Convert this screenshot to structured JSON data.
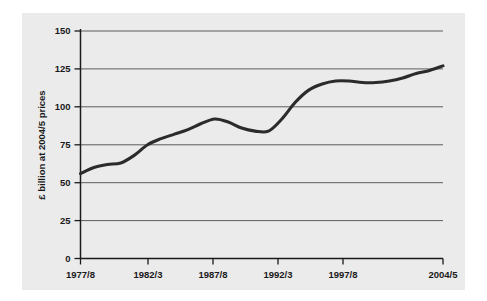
{
  "figure": {
    "background_color": "#ffffff",
    "panel_color": "#ebebeb",
    "line_color": "#2b2b2b",
    "grid_color": "#4d4d4d",
    "axis_color": "#1a1a1a"
  },
  "chart_data": {
    "type": "line",
    "title": "",
    "xlabel": "",
    "ylabel": "£ billion at 2004/5 prices",
    "ylim": [
      0,
      150
    ],
    "yticks": [
      0,
      25,
      50,
      75,
      100,
      125,
      150
    ],
    "ytick_labels": [
      "0",
      "25",
      "50",
      "75",
      "100",
      "125",
      "150"
    ],
    "xtick_labels": [
      "1977/8",
      "1982/3",
      "1987/8",
      "1992/3",
      "1997/8",
      "2004/5"
    ],
    "xtick_values": [
      "1977/8",
      "1982/3",
      "1987/8",
      "1992/3",
      "1997/8",
      "2004/5"
    ],
    "grid": true,
    "grid_axis": "y",
    "legend": false,
    "x": [
      "1977/8",
      "1978/9",
      "1979/80",
      "1980/1",
      "1981/2",
      "1982/3",
      "1983/4",
      "1984/5",
      "1985/6",
      "1986/7",
      "1987/8",
      "1988/9",
      "1989/90",
      "1990/1",
      "1991/2",
      "1992/3",
      "1993/4",
      "1994/5",
      "1995/6",
      "1996/7",
      "1997/8",
      "1998/9",
      "1999/0",
      "2000/1",
      "2001/2",
      "2002/3",
      "2003/4",
      "2004/5"
    ],
    "values": [
      56,
      60,
      62,
      63,
      68,
      75,
      79,
      82,
      85,
      89,
      92,
      90,
      86,
      84,
      84,
      92,
      103,
      111,
      115,
      117,
      117,
      116,
      116,
      117,
      119,
      122,
      124,
      127
    ],
    "series": [
      {
        "name": "£ billion at 2004/5 prices",
        "values": [
          56,
          60,
          62,
          63,
          68,
          75,
          79,
          82,
          85,
          89,
          92,
          90,
          86,
          84,
          84,
          92,
          103,
          111,
          115,
          117,
          117,
          116,
          116,
          117,
          119,
          122,
          124,
          127
        ]
      }
    ]
  }
}
